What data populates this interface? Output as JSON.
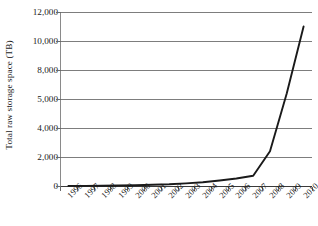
{
  "chart_data": {
    "type": "line",
    "title": "",
    "xlabel": "",
    "ylabel": "Total raw storage space (TB)",
    "categories": [
      "1996",
      "1997",
      "1998",
      "1999",
      "2000",
      "2001",
      "2002",
      "2003",
      "2004",
      "2005",
      "2006",
      "2007",
      "2008",
      "2009",
      "2010"
    ],
    "values": [
      5,
      10,
      20,
      35,
      55,
      80,
      120,
      180,
      260,
      380,
      520,
      700,
      2400,
      5600,
      11000
    ],
    "ytick_labels": [
      "0",
      "2,000",
      "4,000",
      "5,000",
      "8,000",
      "10,000",
      "12,000"
    ],
    "ytick_values": [
      0,
      2000,
      4000,
      5000,
      8000,
      10000,
      12000
    ],
    "ylim": [
      0,
      12000
    ],
    "grid": true,
    "legend": "none",
    "series_color": "#1a1a1a",
    "grid_color": "#7d7d7d",
    "axis_color": "#3a3a3a"
  }
}
